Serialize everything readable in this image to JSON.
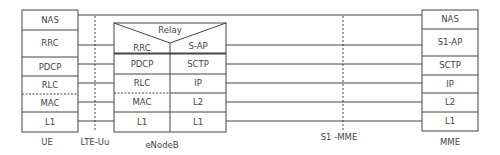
{
  "diagram": {
    "nodes": {
      "ue": {
        "label": "UE",
        "layers": [
          "NAS",
          "RRC",
          "PDCP",
          "RLC",
          "MAC",
          "L1"
        ]
      },
      "enodeb": {
        "label": "eNodeB",
        "relay_label": "Relay",
        "left_layers": [
          "RRC",
          "PDCP",
          "RLC",
          "MAC",
          "L1"
        ],
        "right_layers": [
          "S-AP",
          "SCTP",
          "IP",
          "L2",
          "L1"
        ]
      },
      "mme": {
        "label": "MME",
        "layers": [
          "NAS",
          "S1-AP",
          "SCTP",
          "IP",
          "L2",
          "L1"
        ]
      }
    },
    "interfaces": [
      {
        "label": "LTE-Uu"
      },
      {
        "label": "S1 -MME"
      }
    ]
  }
}
